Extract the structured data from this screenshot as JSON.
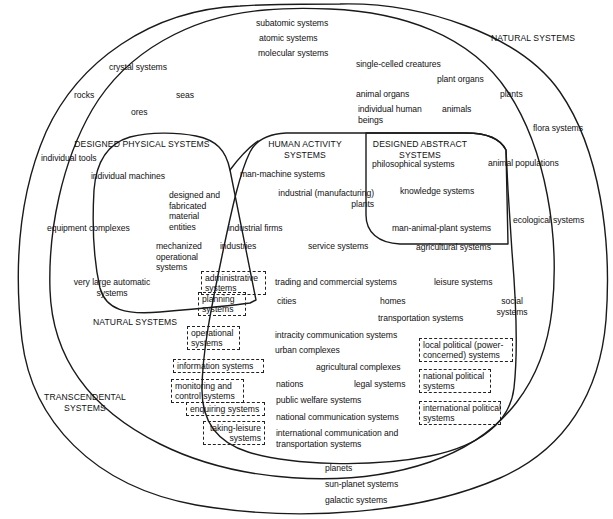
{
  "diagram": {
    "type": "venn-nested-set-diagram",
    "stroke_color": "#1a1a1a",
    "text_color": "#111111",
    "background": "#ffffff",
    "zones": [
      {
        "id": "natural-systems-top",
        "label": "NATURAL SYSTEMS"
      },
      {
        "id": "natural-systems-left",
        "label": "NATURAL SYSTEMS"
      },
      {
        "id": "transcendental-systems",
        "label": "TRANSCENDENTAL\nSYSTEMS"
      },
      {
        "id": "designed-physical-systems",
        "label": "DESIGNED PHYSICAL SYSTEMS"
      },
      {
        "id": "human-activity-systems",
        "label": "HUMAN ACTIVITY\nSYSTEMS"
      },
      {
        "id": "designed-abstract-systems",
        "label": "DESIGNED ABSTRACT\nSYSTEMS"
      }
    ],
    "labels": [
      {
        "id": "subatomic-systems",
        "text": "subatomic systems"
      },
      {
        "id": "atomic-systems",
        "text": "atomic systems"
      },
      {
        "id": "molecular-systems",
        "text": "molecular systems"
      },
      {
        "id": "crystal-systems",
        "text": "crystal systems"
      },
      {
        "id": "rocks",
        "text": "rocks"
      },
      {
        "id": "seas",
        "text": "seas"
      },
      {
        "id": "ores",
        "text": "ores"
      },
      {
        "id": "single-celled-creatures",
        "text": "single-celled creatures"
      },
      {
        "id": "plant-organs",
        "text": "plant organs"
      },
      {
        "id": "animal-organs",
        "text": "animal organs"
      },
      {
        "id": "plants",
        "text": "plants"
      },
      {
        "id": "individual-human-beings",
        "text": "individual human\nbeings"
      },
      {
        "id": "animals",
        "text": "animals"
      },
      {
        "id": "flora-systems",
        "text": "flora systems"
      },
      {
        "id": "animal-populations",
        "text": "animal populations"
      },
      {
        "id": "ecological-systems",
        "text": "ecological systems"
      },
      {
        "id": "individual-tools",
        "text": "individual tools"
      },
      {
        "id": "individual-machines",
        "text": "individual machines"
      },
      {
        "id": "designed-and-fabricated-material-entities",
        "text": "designed and\nfabricated\nmaterial\nentities"
      },
      {
        "id": "equipment-complexes",
        "text": "equipment complexes"
      },
      {
        "id": "mechanized-operational-systems",
        "text": "mechanized\noperational\nsystems"
      },
      {
        "id": "very-large-automatic-systems",
        "text": "very large automatic\nsystems"
      },
      {
        "id": "man-machine-systems",
        "text": "man-machine systems"
      },
      {
        "id": "industrial-manufacturing-plants",
        "text": "industrial (manufacturing)\nplants"
      },
      {
        "id": "industrial-firms",
        "text": "industrial firms"
      },
      {
        "id": "industries",
        "text": "industries"
      },
      {
        "id": "service-systems",
        "text": "service systems"
      },
      {
        "id": "trading-and-commercial-systems",
        "text": "trading and commercial systems"
      },
      {
        "id": "cities",
        "text": "cities"
      },
      {
        "id": "homes",
        "text": "homes"
      },
      {
        "id": "transportation-systems",
        "text": "transportation systems"
      },
      {
        "id": "intracity-communication-systems",
        "text": "intracity communication systems"
      },
      {
        "id": "urban-complexes",
        "text": "urban complexes"
      },
      {
        "id": "agricultural-complexes",
        "text": "agricultural complexes"
      },
      {
        "id": "nations",
        "text": "nations"
      },
      {
        "id": "legal-systems",
        "text": "legal systems"
      },
      {
        "id": "public-welfare-systems",
        "text": "public welfare systems"
      },
      {
        "id": "national-communication-systems",
        "text": "national communication systems"
      },
      {
        "id": "international-communication-and-transportation-systems",
        "text": "international communication and\ntransportation systems"
      },
      {
        "id": "philosophical-systems",
        "text": "philosophical systems"
      },
      {
        "id": "knowledge-systems",
        "text": "knowledge systems"
      },
      {
        "id": "man-animal-plant-systems",
        "text": "man-animal-plant systems"
      },
      {
        "id": "agricultural-systems",
        "text": "agricultural systems"
      },
      {
        "id": "leisure-systems",
        "text": "leisure systems"
      },
      {
        "id": "social-systems",
        "text": "social\nsystems"
      },
      {
        "id": "planets",
        "text": "planets"
      },
      {
        "id": "sun-planet-systems",
        "text": "sun-planet systems"
      },
      {
        "id": "galactic-systems",
        "text": "galactic systems"
      }
    ],
    "boxed_labels": [
      {
        "id": "administrative-systems",
        "text": "administrative\nsystems"
      },
      {
        "id": "planning-systems",
        "text": "planning\nsystems"
      },
      {
        "id": "operational-systems",
        "text": "operational\nsystems"
      },
      {
        "id": "information-systems",
        "text": "information systems"
      },
      {
        "id": "monitoring-and-control-systems",
        "text": "monitoring and\ncontrol systems"
      },
      {
        "id": "enquiring-systems",
        "text": "enquiring systems"
      },
      {
        "id": "taking-leisure-systems",
        "text": "taking-leisure\nsystems"
      },
      {
        "id": "local-political-power-concerned-systems",
        "text": "local political (power-\nconcerned) systems"
      },
      {
        "id": "national-political-systems",
        "text": "national political\nsystems"
      },
      {
        "id": "international-political-systems",
        "text": "international political\nsystems"
      }
    ]
  }
}
